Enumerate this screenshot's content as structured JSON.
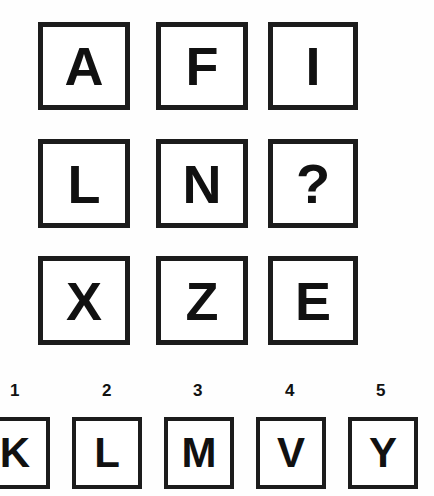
{
  "puzzle": {
    "type": "letter-series-matrix",
    "matrix": {
      "rows": 3,
      "cols": 3,
      "cells": [
        {
          "label": "A",
          "is_missing": false
        },
        {
          "label": "F",
          "is_missing": false
        },
        {
          "label": "I",
          "is_missing": false
        },
        {
          "label": "L",
          "is_missing": false
        },
        {
          "label": "N",
          "is_missing": false
        },
        {
          "label": "?",
          "is_missing": true
        },
        {
          "label": "X",
          "is_missing": false
        },
        {
          "label": "Z",
          "is_missing": false
        },
        {
          "label": "E",
          "is_missing": false
        }
      ]
    },
    "options": [
      {
        "number": "1",
        "label": "K"
      },
      {
        "number": "2",
        "label": "L"
      },
      {
        "number": "3",
        "label": "M"
      },
      {
        "number": "4",
        "label": "V"
      },
      {
        "number": "5",
        "label": "Y"
      }
    ],
    "colors": {
      "border": "#1c1c1c",
      "glyph": "#111111",
      "background": "#fefefe",
      "cell_fill": "#ffffff"
    }
  }
}
